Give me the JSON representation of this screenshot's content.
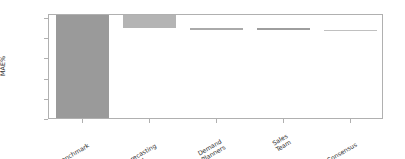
{
  "chart_data": {
    "type": "bar",
    "subtype": "waterfall",
    "title": "",
    "xlabel": "",
    "ylabel": "MAE%",
    "categories": [
      "Benchmark",
      "Forecasting\nModel",
      "Demand\nPlanners",
      "Sales\nTeam",
      "Consensus"
    ],
    "ylim": [
      0,
      52
    ],
    "grid": false,
    "legend": null,
    "ytick_labels": [
      "0%",
      "10%",
      "20%",
      "30%",
      "40%",
      "50%"
    ],
    "ytick_values": [
      0,
      10,
      20,
      30,
      40,
      50
    ],
    "bars": [
      {
        "label": "Benchmark",
        "bottom": 0,
        "top": 51.8,
        "value": 51.8,
        "color": "#9a9a9a"
      },
      {
        "label": "Forecasting Model",
        "bottom": 45.4,
        "top": 51.8,
        "value": -6.4,
        "color": "#b4b4b4"
      },
      {
        "label": "Demand Planners",
        "bottom": 44.5,
        "top": 45.4,
        "value": -0.9,
        "color": "#aaaaaa"
      },
      {
        "label": "Sales Team",
        "bottom": 44.5,
        "top": 45.4,
        "value": -0.9,
        "color": "#9e9e9e"
      },
      {
        "label": "Consensus",
        "bottom": 44.4,
        "top": 44.6,
        "value": -0.1,
        "color": "#c0c0c0"
      }
    ],
    "series": [
      {
        "name": "MAE%",
        "values": [
          51.8,
          45.4,
          44.5,
          44.5,
          44.5
        ]
      }
    ]
  },
  "axes": {
    "frame_color": "#b0b0b0",
    "tick_color": "#b0b0b0",
    "text_color": "#303030",
    "background": "#ffffff"
  }
}
